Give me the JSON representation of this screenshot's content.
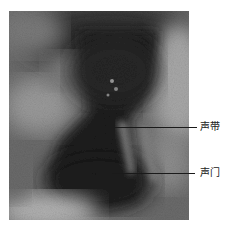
{
  "figure": {
    "type": "endoscopic laryngeal image",
    "annotations": [
      {
        "label": "声带",
        "meaning": "vocal cord",
        "line_y": 127,
        "line_x1": 115,
        "line_x2": 197,
        "label_x": 200
      },
      {
        "label": "声门",
        "meaning": "glottis",
        "line_y": 173,
        "line_x1": 112,
        "line_x2": 195,
        "label_x": 200
      }
    ]
  }
}
